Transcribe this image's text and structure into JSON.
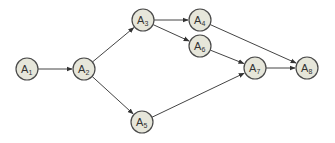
{
  "diagram": {
    "type": "directed-graph",
    "node_color": "#e6e6da",
    "edge_color": "#444444",
    "node_radius": 11,
    "nodes": [
      {
        "id": "A1",
        "letter": "A",
        "sub": "1",
        "x": 27,
        "y": 69
      },
      {
        "id": "A2",
        "letter": "A",
        "sub": "2",
        "x": 84,
        "y": 69
      },
      {
        "id": "A3",
        "letter": "A",
        "sub": "3",
        "x": 143,
        "y": 20
      },
      {
        "id": "A4",
        "letter": "A",
        "sub": "4",
        "x": 200,
        "y": 20
      },
      {
        "id": "A5",
        "letter": "A",
        "sub": "5",
        "x": 142,
        "y": 122
      },
      {
        "id": "A6",
        "letter": "A",
        "sub": "6",
        "x": 200,
        "y": 46
      },
      {
        "id": "A7",
        "letter": "A",
        "sub": "7",
        "x": 255,
        "y": 68
      },
      {
        "id": "A8",
        "letter": "A",
        "sub": "8",
        "x": 307,
        "y": 68
      }
    ],
    "edges": [
      {
        "from": "A1",
        "to": "A2"
      },
      {
        "from": "A2",
        "to": "A3"
      },
      {
        "from": "A2",
        "to": "A5"
      },
      {
        "from": "A3",
        "to": "A4"
      },
      {
        "from": "A3",
        "to": "A6"
      },
      {
        "from": "A4",
        "to": "A8"
      },
      {
        "from": "A6",
        "to": "A7"
      },
      {
        "from": "A5",
        "to": "A7"
      },
      {
        "from": "A7",
        "to": "A8"
      }
    ]
  }
}
